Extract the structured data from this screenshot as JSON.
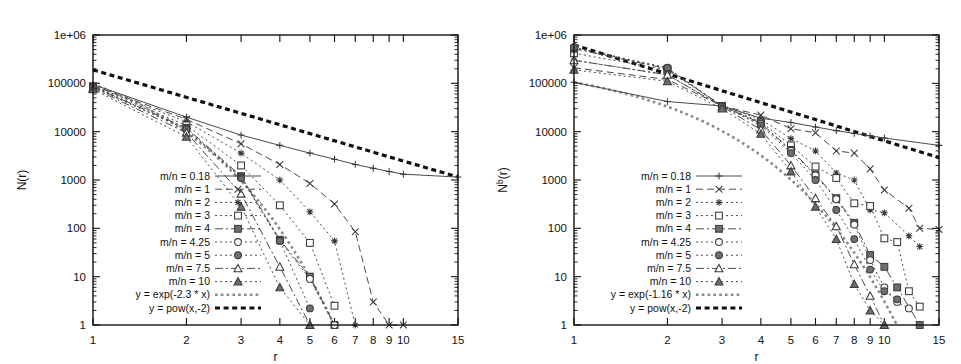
{
  "figure": {
    "panels": [
      "left",
      "right"
    ],
    "background": "#ffffff",
    "ink_color": "#111111",
    "reference_gray": "#8a8a8a"
  },
  "chart_data": [
    {
      "id": "left",
      "type": "line",
      "title": "",
      "xlabel": "r",
      "ylabel": "N(r)",
      "xscale": "log",
      "yscale": "log",
      "xlim": [
        1,
        15
      ],
      "ylim": [
        1,
        1000000
      ],
      "grid": false,
      "legend_position": "inside-lower-left",
      "xticks": [
        1,
        2,
        3,
        4,
        5,
        6,
        7,
        8,
        9,
        10,
        15
      ],
      "xtick_labels": [
        "1",
        "2",
        "3",
        "4",
        "5",
        "6",
        "7",
        "8",
        "9",
        "10",
        "15"
      ],
      "yticks": [
        1,
        10,
        100,
        1000,
        10000,
        100000,
        1000000
      ],
      "ytick_labels": [
        "1",
        "10",
        "100",
        "1000",
        "10000",
        "100000",
        "1e+06"
      ],
      "series": [
        {
          "name": "m/n = 0.18",
          "marker": "plus",
          "dash": "solid",
          "x": [
            1,
            2,
            3,
            4,
            5,
            6,
            7,
            8,
            9,
            10,
            15
          ],
          "y": [
            95000,
            20000,
            8500,
            5200,
            3600,
            2700,
            2100,
            1750,
            1500,
            1320,
            1150
          ]
        },
        {
          "name": "m/n = 1",
          "marker": "cross",
          "dash": "dash",
          "x": [
            1,
            2,
            3,
            4,
            5,
            6,
            7,
            8,
            9,
            10
          ],
          "y": [
            90000,
            18000,
            5600,
            2100,
            850,
            320,
            85,
            3,
            1,
            1
          ]
        },
        {
          "name": "m/n = 2",
          "marker": "asterisk",
          "dash": "dot",
          "x": [
            1,
            2,
            3,
            4,
            5,
            6,
            7
          ],
          "y": [
            88000,
            16000,
            3600,
            1000,
            220,
            55,
            1
          ]
        },
        {
          "name": "m/n = 3",
          "marker": "opensquare",
          "dash": "dot",
          "x": [
            1,
            2,
            3,
            4,
            5,
            6
          ],
          "y": [
            86000,
            13500,
            2000,
            300,
            50,
            2.5
          ]
        },
        {
          "name": "m/n = 4",
          "marker": "fillsquare",
          "dash": "dashdot",
          "x": [
            1,
            2,
            3,
            4,
            5,
            6
          ],
          "y": [
            85000,
            12000,
            1200,
            58,
            10,
            1
          ]
        },
        {
          "name": "m/n = 4.25",
          "marker": "opencircle",
          "dash": "dot",
          "x": [
            1,
            2,
            3,
            4,
            5,
            6
          ],
          "y": [
            84000,
            11500,
            1150,
            55,
            9,
            1
          ]
        },
        {
          "name": "m/n = 5",
          "marker": "fillcircle",
          "dash": "dot",
          "x": [
            1,
            2,
            3,
            4,
            5
          ],
          "y": [
            83000,
            11000,
            1100,
            55,
            2.2
          ]
        },
        {
          "name": "m/n = 7.5",
          "marker": "opentri",
          "dash": "dashdot",
          "x": [
            1,
            2,
            3,
            4,
            5
          ],
          "y": [
            80000,
            9500,
            520,
            16,
            1
          ]
        },
        {
          "name": "m/n = 10",
          "marker": "filltri",
          "dash": "dot",
          "x": [
            1,
            2,
            3,
            4,
            5
          ],
          "y": [
            75000,
            7800,
            280,
            6,
            1
          ]
        }
      ],
      "reference_lines": [
        {
          "name": "y = exp(-2.3 * x)",
          "style": "thick-gray-dotted",
          "formula": "exp(-2.3*x)"
        },
        {
          "name": "y = pow(x,-2)",
          "style": "thick-black-dashed",
          "formula": "pow(x,-2)",
          "x": [
            1,
            15
          ],
          "y": [
            190000,
            1150
          ]
        }
      ],
      "legend_entries": [
        "m/n = 0.18",
        "m/n = 1",
        "m/n = 2",
        "m/n = 3",
        "m/n = 4",
        "m/n = 4.25",
        "m/n = 5",
        "m/n = 7.5",
        "m/n = 10",
        "y = exp(-2.3 * x)",
        "y = pow(x,-2)"
      ]
    },
    {
      "id": "right",
      "type": "line",
      "title": "",
      "xlabel": "r",
      "ylabel": "N^b(r)",
      "ylabel_base": "N",
      "ylabel_sup": "b",
      "ylabel_tail": "(r)",
      "xscale": "log",
      "yscale": "log",
      "xlim": [
        1,
        15
      ],
      "ylim": [
        1,
        1000000
      ],
      "grid": false,
      "legend_position": "inside-lower-left",
      "xticks": [
        1,
        2,
        3,
        4,
        5,
        6,
        7,
        8,
        9,
        10,
        15
      ],
      "xtick_labels": [
        "1",
        "2",
        "3",
        "4",
        "5",
        "6",
        "7",
        "8",
        "9",
        "10",
        "15"
      ],
      "yticks": [
        1,
        10,
        100,
        1000,
        10000,
        100000,
        1000000
      ],
      "ytick_labels": [
        "1",
        "10",
        "100",
        "1000",
        "10000",
        "100000",
        "1e+06"
      ],
      "series": [
        {
          "name": "m/n = 0.18",
          "marker": "plus",
          "dash": "solid",
          "x": [
            1,
            2,
            3,
            4,
            5,
            6,
            7,
            8,
            9,
            10,
            15
          ],
          "y": [
            105000,
            42000,
            34000,
            19000,
            15500,
            12500,
            10500,
            9200,
            8200,
            7400,
            5200
          ]
        },
        {
          "name": "m/n = 1",
          "marker": "cross",
          "dash": "dash",
          "x": [
            1,
            2,
            3,
            4,
            5,
            6,
            7,
            8,
            9,
            10,
            12,
            13,
            15
          ],
          "y": [
            210000,
            120000,
            34000,
            22000,
            11500,
            9500,
            4000,
            3600,
            1700,
            620,
            260,
            100,
            95
          ]
        },
        {
          "name": "m/n = 2",
          "marker": "asterisk",
          "dash": "dot",
          "x": [
            1,
            2,
            3,
            4,
            5,
            6,
            7,
            8,
            9,
            10,
            12,
            13
          ],
          "y": [
            300000,
            150000,
            34000,
            18000,
            7200,
            4000,
            1400,
            1000,
            240,
            210,
            70,
            42
          ]
        },
        {
          "name": "m/n = 3",
          "marker": "opensquare",
          "dash": "dot",
          "x": [
            1,
            2,
            3,
            4,
            5,
            6,
            7,
            8,
            9,
            10,
            11,
            12,
            13
          ],
          "y": [
            420000,
            190000,
            34000,
            16000,
            5200,
            1900,
            1100,
            330,
            290,
            62,
            52,
            5,
            2.4
          ]
        },
        {
          "name": "m/n = 4",
          "marker": "fillsquare",
          "dash": "dashdot",
          "x": [
            1,
            2,
            3,
            4,
            5,
            6,
            7,
            8,
            9,
            10,
            11,
            13
          ],
          "y": [
            520000,
            200000,
            34000,
            15000,
            4200,
            1300,
            420,
            130,
            28,
            16,
            6,
            1
          ]
        },
        {
          "name": "m/n = 4.25",
          "marker": "opencircle",
          "dash": "dot",
          "x": [
            1,
            2,
            3,
            4,
            5,
            6,
            7,
            8,
            9,
            10,
            11,
            12
          ],
          "y": [
            540000,
            205000,
            34000,
            14500,
            4000,
            1250,
            400,
            120,
            22,
            6,
            3,
            2.2
          ]
        },
        {
          "name": "m/n = 5",
          "marker": "fillcircle",
          "dash": "dot",
          "x": [
            1,
            2,
            3,
            4,
            5,
            6,
            7,
            8,
            9,
            10,
            11
          ],
          "y": [
            560000,
            210000,
            34000,
            13500,
            3600,
            1000,
            240,
            60,
            14,
            5,
            3.4
          ]
        },
        {
          "name": "m/n = 7.5",
          "marker": "opentri",
          "dash": "dashdot",
          "x": [
            1,
            2,
            3,
            4,
            5,
            6,
            7,
            8,
            9,
            10
          ],
          "y": [
            300000,
            150000,
            33000,
            11000,
            2000,
            420,
            110,
            18,
            4,
            1
          ]
        },
        {
          "name": "m/n = 10",
          "marker": "filltri",
          "dash": "dot",
          "x": [
            1,
            2,
            3,
            4,
            5,
            6,
            7,
            8,
            9,
            10
          ],
          "y": [
            190000,
            110000,
            30000,
            9000,
            1500,
            280,
            60,
            7,
            2,
            1
          ]
        }
      ],
      "reference_lines": [
        {
          "name": "y = exp(-1.16 * x)",
          "style": "thick-gray-dotted",
          "formula": "exp(-1.16*x)"
        },
        {
          "name": "y = pow(x,-2)",
          "style": "thick-black-dashed",
          "formula": "pow(x,-2)",
          "x": [
            1,
            15
          ],
          "y": [
            620000,
            2900
          ]
        }
      ],
      "legend_entries": [
        "m/n = 0.18",
        "m/n = 1",
        "m/n = 2",
        "m/n = 3",
        "m/n = 4",
        "m/n = 4.25",
        "m/n = 5",
        "m/n = 7.5",
        "m/n = 10",
        "y = exp(-1.16 * x)",
        "y = pow(x,-2)"
      ]
    }
  ]
}
